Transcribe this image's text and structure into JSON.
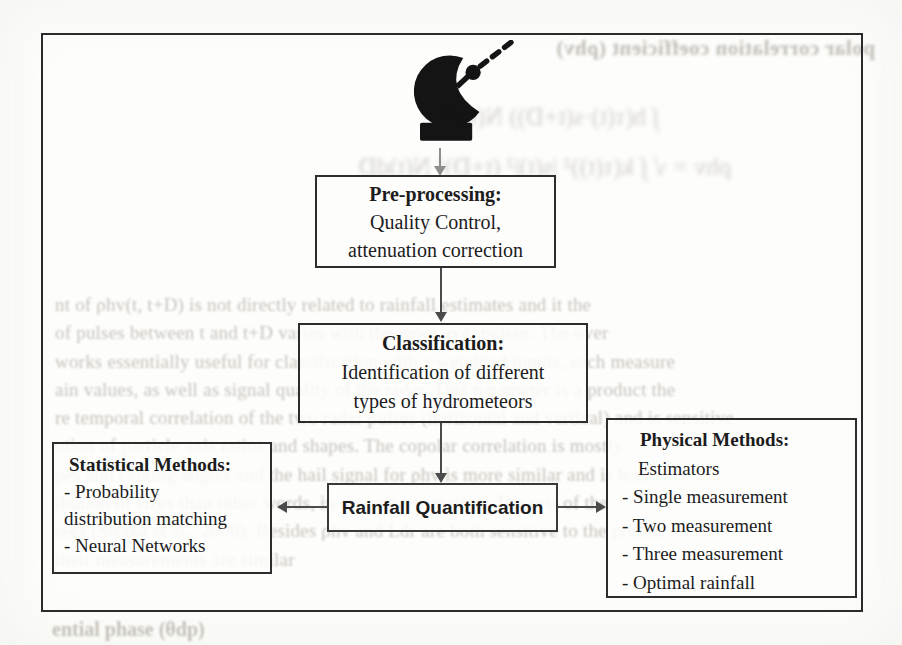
{
  "diagram": {
    "preprocessing": {
      "title": "Pre-processing:",
      "lines": [
        "Quality Control,",
        "attenuation correction"
      ]
    },
    "classification": {
      "title": "Classification:",
      "lines": [
        "Identification of different",
        "types of hydrometeors"
      ]
    },
    "quantification": {
      "title": "Rainfall Quantification"
    },
    "statistical": {
      "title": "Statistical Methods:",
      "lines": [
        "- Probability",
        "distribution matching",
        "- Neural Networks"
      ]
    },
    "physical": {
      "title": "Physical Methods:",
      "lines": [
        "Estimators",
        "- Single measurement",
        "- Two measurement",
        "- Three measurement",
        "- Optimal rainfall"
      ]
    },
    "icon": "radar-dish-icon"
  },
  "bleedthrough": {
    "heading": "polar correlation coefficient (ρhv)",
    "formula_lines": [
      "∫ h(τ(t)·s(t+D)) N(t)dD",
      "ρhv = √ ∫ k(τ(t))² |s(t)|² (t+D)² N(t)dD"
    ],
    "paragraph_lines": [
      "nt of ρhv(t, t+D) is not directly related to rainfall estimates and it the",
      "of pulses between t and t+D varies with the more avg. pulses. The over",
      "works essentially useful for classification with a weighted inputs, each measure",
      "ain values, as well as signal quality of the radar. This parameter is a product the",
      "re temporal correlation of the two radar pulses (horizontal and vertical) and is sensitive",
      "ution of particle axis ratios and shapes. The copolar correlation is mostly",
      "pes and canting angles and the hail signal for ρhv is more similar and is less",
      "ibution of sizes than other words, in the rain estimation. The rest of the",
      "rees (Straka et al., 2000). Besides ρhv and Ldr are both sensitive to the presen",
      "their measurements are similar"
    ],
    "footer": "ential phase (θdp)"
  },
  "colors": {
    "ink": "#1c1c1c",
    "box_border": "#2d2d2d",
    "outer_border": "#2b2b2b",
    "arrow": "#4b4b4b",
    "light_arrow": "#8e8e8e",
    "bleed_text": "#8f897c",
    "paper": "#fdfdfb"
  }
}
